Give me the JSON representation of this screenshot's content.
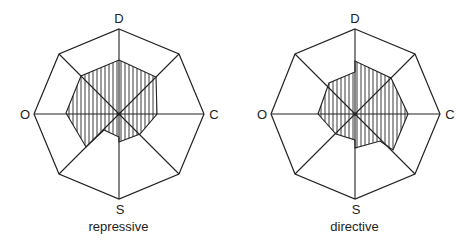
{
  "figures": [
    {
      "caption": "repressive",
      "axes": {
        "top": "D",
        "left": "O",
        "right": "C",
        "bottom": "S"
      },
      "center": [
        119,
        114
      ],
      "radius": 85,
      "profile_points": "119,60 156,77 157,114 140,134 119,142 119,137 104,130 86,147 66,113 81,76"
    },
    {
      "caption": "directive",
      "axes": {
        "top": "D",
        "left": "O",
        "right": "C",
        "bottom": "S"
      },
      "center": [
        119,
        114
      ],
      "radius": 85,
      "profile_points": "119,61 119,72 93,83 82,114 100,134 119,140 119,148 144,141 157,150 172,114 155,78"
    }
  ],
  "colors": {
    "line": "#222222",
    "background": "#ffffff"
  }
}
